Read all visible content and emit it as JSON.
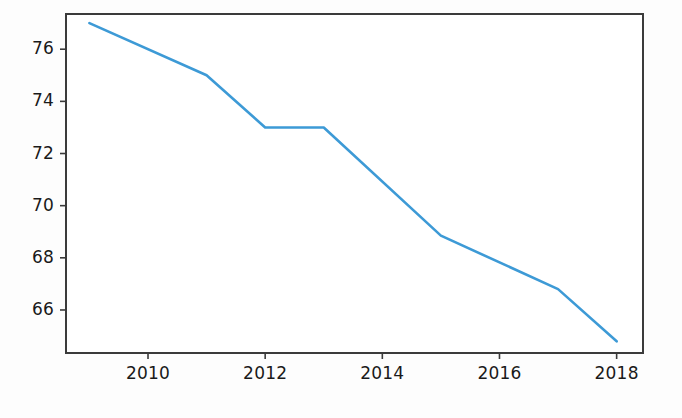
{
  "chart_data": {
    "type": "line",
    "title": "",
    "xlabel": "",
    "ylabel": "",
    "x": [
      2009,
      2011,
      2012,
      2013,
      2015,
      2017,
      2018
    ],
    "values": [
      77.0,
      75.0,
      73.0,
      73.0,
      68.85,
      66.8,
      64.8
    ],
    "series": [
      {
        "name": "",
        "x": [
          2009,
          2011,
          2012,
          2013,
          2015,
          2017,
          2018
        ],
        "values": [
          77.0,
          75.0,
          73.0,
          73.0,
          68.85,
          66.8,
          64.8
        ]
      }
    ],
    "xlim": [
      2008.6,
      2018.45
    ],
    "ylim": [
      64.35,
      77.35
    ],
    "xticks": [
      2010,
      2012,
      2014,
      2016,
      2018
    ],
    "xtick_labels": [
      "2010",
      "2012",
      "2014",
      "2016",
      "2018"
    ],
    "yticks": [
      66,
      68,
      70,
      72,
      74,
      76
    ],
    "ytick_labels": [
      "66",
      "68",
      "70",
      "72",
      "74",
      "76"
    ],
    "grid": false,
    "legend": null,
    "line_color": "#3d9ad6",
    "axes_color": "#3b3b3b",
    "background_color": "#ffffff",
    "line_width": 2.6
  },
  "figure": {
    "plot_left": 66,
    "plot_right": 643,
    "plot_top": 14,
    "plot_bottom": 353
  }
}
